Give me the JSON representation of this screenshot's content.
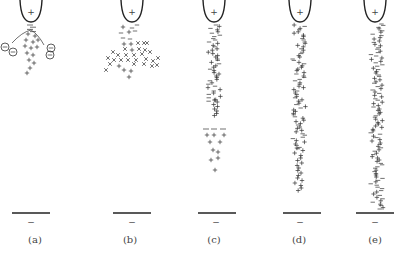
{
  "figure": {
    "electrode_top_sign": "+",
    "electrode_bottom_sign": "−",
    "panels": [
      {
        "id": "a",
        "label": "(a)",
        "cx": 35,
        "stage": "electron avalanches with negative ions",
        "negative_ion_symbol": "⊖"
      },
      {
        "id": "b",
        "label": "(b)",
        "cx": 130,
        "stage": "space charge spreading"
      },
      {
        "id": "c",
        "label": "(c)",
        "cx": 214,
        "stage": "streamer with separated head"
      },
      {
        "id": "d",
        "label": "(d)",
        "cx": 299,
        "stage": "streamer approaching cathode"
      },
      {
        "id": "e",
        "label": "(e)",
        "cx": 375,
        "stage": "streamer bridging gap"
      }
    ]
  },
  "colors": {
    "ink": "#333333",
    "background": "#ffffff"
  }
}
